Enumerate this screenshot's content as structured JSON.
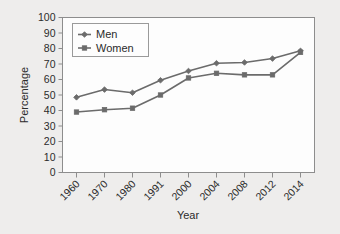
{
  "chart_data": {
    "type": "line",
    "title": "",
    "xlabel": "Year",
    "ylabel": "Percentage",
    "categories": [
      "1960",
      "1970",
      "1980",
      "1991",
      "2000",
      "2004",
      "2008",
      "2012",
      "2014"
    ],
    "series": [
      {
        "name": "Men",
        "color": "#6b6b6b",
        "marker": "diamond",
        "values": [
          48.5,
          53.5,
          51.5,
          59.5,
          65.5,
          70.5,
          71,
          73.5,
          78.5
        ]
      },
      {
        "name": "Women",
        "color": "#6b6b6b",
        "marker": "square",
        "values": [
          39,
          40.5,
          41.5,
          50,
          61,
          64,
          63,
          63,
          77.5
        ]
      }
    ],
    "ylim": [
      0,
      100
    ],
    "ytick_step": 10,
    "yticks": [
      "0",
      "10",
      "20",
      "30",
      "40",
      "50",
      "60",
      "70",
      "80",
      "90",
      "100"
    ],
    "grid": false,
    "legend_position": "top-left",
    "xtick_rotation": -45
  },
  "colors": {
    "background": "#eeedec",
    "plot_background": "#fdfdfd",
    "frame": "#8d8d8d",
    "text": "#2b2b2b",
    "series": "#6b6b6b"
  }
}
